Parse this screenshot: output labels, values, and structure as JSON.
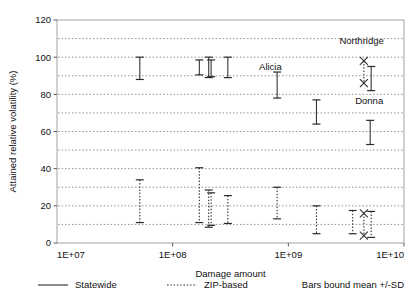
{
  "chart_data": {
    "type": "scatter",
    "title": "",
    "xlabel": "Damage amount",
    "ylabel": "Attained relative volatility (%)",
    "xscale": "log",
    "xlim": [
      10000000,
      10000000000
    ],
    "ylim": [
      0,
      120
    ],
    "xticks": [
      "1E+07",
      "1E+08",
      "1E+09",
      "1E+10"
    ],
    "xtick_values": [
      10000000,
      100000000,
      1000000000,
      10000000000
    ],
    "yticks": [
      0,
      20,
      40,
      60,
      80,
      100,
      120
    ],
    "minor_gridlines": [
      10,
      30,
      50,
      70,
      90,
      110
    ],
    "grid": "horizontal-dotted",
    "legend_position": "bottom",
    "series": [
      {
        "name": "Statewide",
        "style": "solid",
        "cap": "flat",
        "points": [
          {
            "x": 52000000,
            "mean": 94.0,
            "low": 88.0,
            "high": 100.0
          },
          {
            "x": 170000000,
            "mean": 94.5,
            "low": 90.5,
            "high": 98.5
          },
          {
            "x": 205000000,
            "mean": 94.5,
            "low": 89.0,
            "high": 100.0
          },
          {
            "x": 215000000,
            "mean": 94.0,
            "low": 89.5,
            "high": 98.5
          },
          {
            "x": 300000000,
            "mean": 94.5,
            "low": 89.0,
            "high": 100.0
          },
          {
            "x": 800000000,
            "mean": 85.0,
            "low": 78.0,
            "high": 92.0
          },
          {
            "x": 1750000000,
            "mean": 70.5,
            "low": 64.0,
            "high": 77.0
          },
          {
            "x": 5200000000,
            "mean": 88.5,
            "low": 82.0,
            "high": 95.0
          },
          {
            "x": 5100000000,
            "mean": 59.5,
            "low": 53.0,
            "high": 66.0
          }
        ]
      },
      {
        "name": "ZIP-based",
        "style": "dotted",
        "cap": "flat",
        "points": [
          {
            "x": 52000000,
            "mean": 22.5,
            "low": 11.0,
            "high": 34.0
          },
          {
            "x": 170000000,
            "mean": 25.5,
            "low": 11.0,
            "high": 40.5
          },
          {
            "x": 205000000,
            "mean": 18.5,
            "low": 8.5,
            "high": 28.5
          },
          {
            "x": 215000000,
            "mean": 18.0,
            "low": 9.5,
            "high": 27.0
          },
          {
            "x": 300000000,
            "mean": 18.0,
            "low": 10.5,
            "high": 25.5
          },
          {
            "x": 800000000,
            "mean": 21.5,
            "low": 13.0,
            "high": 30.0
          },
          {
            "x": 1750000000,
            "mean": 12.5,
            "low": 5.0,
            "high": 20.0
          },
          {
            "x": 3600000000,
            "mean": 11.0,
            "low": 5.0,
            "high": 17.5
          },
          {
            "x": 5200000000,
            "mean": 10.0,
            "low": 3.0,
            "high": 17.0
          }
        ]
      },
      {
        "name": "Northridge-marker",
        "style": "dotted",
        "cap": "x",
        "points": [
          {
            "x": 4500000000,
            "mean": 92.0,
            "low": 86.0,
            "high": 98.0
          }
        ]
      },
      {
        "name": "lower-x-marker",
        "style": "dotted",
        "cap": "x",
        "points": [
          {
            "x": 4500000000,
            "mean": 10.0,
            "low": 4.0,
            "high": 16.0
          }
        ]
      }
    ],
    "annotations": [
      {
        "text": "Alicia",
        "x": 700000000,
        "y": 93.0
      },
      {
        "text": "Northridge",
        "x": 4300000000,
        "y": 107.0
      },
      {
        "text": "Donna",
        "x": 5000000000,
        "y": 75.0
      }
    ]
  },
  "legend": {
    "entries": [
      {
        "label": "Statewide",
        "style": "solid"
      },
      {
        "label": "ZIP-based",
        "style": "dotted"
      }
    ],
    "note": "Bars bound mean +/-SD"
  }
}
